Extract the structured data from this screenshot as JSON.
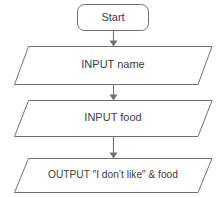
{
  "diagram": {
    "colors": {
      "stroke": "#6e7275",
      "text": "#3d4043",
      "background": "#ffffff"
    },
    "nodes": [
      {
        "id": "start",
        "shape": "terminator",
        "label": "Start"
      },
      {
        "id": "input-name",
        "shape": "parallelogram",
        "label": "INPUT name"
      },
      {
        "id": "input-food",
        "shape": "parallelogram",
        "label": "INPUT food"
      },
      {
        "id": "output-message",
        "shape": "parallelogram",
        "label": "OUTPUT \"I don’t like\" & food"
      }
    ],
    "connectors": [
      {
        "id": "start-to-input-name",
        "from": "start",
        "to": "input-name",
        "arrow": "down"
      },
      {
        "id": "input-name-to-input-food",
        "from": "input-name",
        "to": "input-food",
        "arrow": "down"
      },
      {
        "id": "input-food-to-output-message",
        "from": "input-food",
        "to": "output-message",
        "arrow": "down"
      }
    ]
  }
}
